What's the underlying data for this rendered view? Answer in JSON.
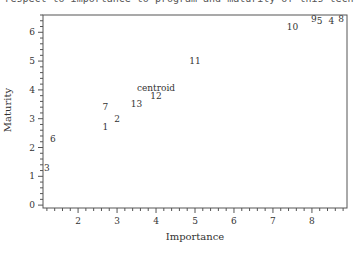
{
  "caption": "respect to importance to program and maturity of this tech",
  "chart_data": {
    "type": "scatter",
    "title": "",
    "xlabel": "Importance",
    "ylabel": "Maturity",
    "xlim": [
      1.1,
      8.9
    ],
    "ylim": [
      -0.1,
      6.6
    ],
    "x_ticks": [
      2,
      3,
      4,
      5,
      6,
      7,
      8
    ],
    "y_ticks": [
      0,
      1,
      2,
      3,
      4,
      5,
      6
    ],
    "grid": false,
    "legend": null,
    "points": [
      {
        "label": "3",
        "x": 1.2,
        "y": 1.3
      },
      {
        "label": "6",
        "x": 1.35,
        "y": 2.3
      },
      {
        "label": "1",
        "x": 2.7,
        "y": 2.7
      },
      {
        "label": "2",
        "x": 3.0,
        "y": 3.0
      },
      {
        "label": "7",
        "x": 2.7,
        "y": 3.4
      },
      {
        "label": "13",
        "x": 3.5,
        "y": 3.5
      },
      {
        "label": "12",
        "x": 4.0,
        "y": 3.8
      },
      {
        "label": "centroid",
        "x": 4.0,
        "y": 4.05
      },
      {
        "label": "11",
        "x": 5.0,
        "y": 5.0
      },
      {
        "label": "10",
        "x": 7.5,
        "y": 6.2
      },
      {
        "label": "9",
        "x": 8.05,
        "y": 6.45
      },
      {
        "label": "5",
        "x": 8.2,
        "y": 6.4
      },
      {
        "label": "4",
        "x": 8.5,
        "y": 6.4
      },
      {
        "label": "8",
        "x": 8.75,
        "y": 6.45
      }
    ]
  }
}
